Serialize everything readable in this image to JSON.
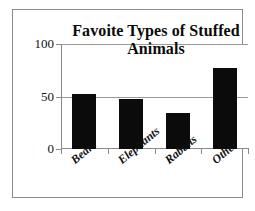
{
  "chart_data": {
    "type": "bar",
    "title": "Favoite Types of Stuffed Animals",
    "title_line1": "Favoite Types of Stuffed",
    "title_line2": "Animals",
    "xlabel": "",
    "ylabel": "",
    "categories": [
      "Bears",
      "Elephants",
      "Rabbits",
      "Other"
    ],
    "values": [
      52,
      48,
      34,
      77
    ],
    "ylim": [
      0,
      100
    ],
    "ytick_labels": [
      "0",
      "50",
      "100"
    ],
    "ytick_values": [
      0,
      50,
      100
    ],
    "grid": true,
    "grid_lines_at": [
      50,
      100
    ],
    "legend": null,
    "legend_position": "none",
    "bar_color": "#0b0b0b",
    "gridline_color": "#9a9a9a",
    "axis_color": "#8a8a8a",
    "frame_color": "#8c8c8c",
    "background_color": "#ffffff"
  }
}
